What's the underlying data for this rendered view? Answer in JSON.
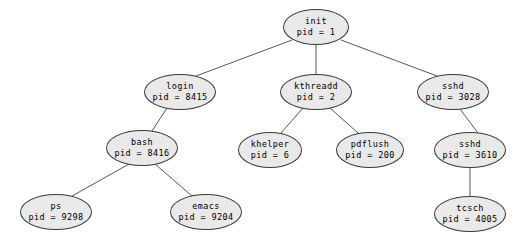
{
  "diagram": {
    "background_color": "#ffffff",
    "node_fill": "#e9e9e9",
    "node_stroke": "#3a3a3a",
    "edge_color": "#444444",
    "nodes": [
      {
        "id": "init",
        "name": "init",
        "pid_label": "pid = 1",
        "cx": 316,
        "cy": 27,
        "rx": 33,
        "ry": 18
      },
      {
        "id": "login",
        "name": "login",
        "pid_label": "pid = 8415",
        "cx": 180,
        "cy": 92,
        "rx": 36,
        "ry": 18
      },
      {
        "id": "kthreadd",
        "name": "kthreadd",
        "pid_label": "pid = 2",
        "cx": 316,
        "cy": 92,
        "rx": 36,
        "ry": 18
      },
      {
        "id": "sshd3028",
        "name": "sshd",
        "pid_label": "pid = 3028",
        "cx": 453,
        "cy": 92,
        "rx": 36,
        "ry": 18
      },
      {
        "id": "bash",
        "name": "bash",
        "pid_label": "pid = 8416",
        "cx": 142,
        "cy": 148,
        "rx": 36,
        "ry": 18
      },
      {
        "id": "khelper",
        "name": "khelper",
        "pid_label": "pid = 6",
        "cx": 270,
        "cy": 150,
        "rx": 32,
        "ry": 18
      },
      {
        "id": "pdflush",
        "name": "pdflush",
        "pid_label": "pid = 200",
        "cx": 370,
        "cy": 150,
        "rx": 34,
        "ry": 18
      },
      {
        "id": "sshd3610",
        "name": "sshd",
        "pid_label": "pid = 3610",
        "cx": 470,
        "cy": 150,
        "rx": 36,
        "ry": 18
      },
      {
        "id": "ps",
        "name": "ps",
        "pid_label": "pid = 9298",
        "cx": 56,
        "cy": 212,
        "rx": 36,
        "ry": 18
      },
      {
        "id": "emacs",
        "name": "emacs",
        "pid_label": "pid = 9204",
        "cx": 206,
        "cy": 212,
        "rx": 36,
        "ry": 18
      },
      {
        "id": "tcsch",
        "name": "tcsch",
        "pid_label": "pid = 4005",
        "cx": 470,
        "cy": 214,
        "rx": 36,
        "ry": 18
      }
    ],
    "edges": [
      {
        "from": "init",
        "to": "login",
        "x1": 292,
        "y1": 40,
        "x2": 196,
        "y2": 76
      },
      {
        "from": "init",
        "to": "kthreadd",
        "x1": 316,
        "y1": 45,
        "x2": 316,
        "y2": 74
      },
      {
        "from": "init",
        "to": "sshd3028",
        "x1": 341,
        "y1": 40,
        "x2": 437,
        "y2": 76
      },
      {
        "from": "login",
        "to": "bash",
        "x1": 167,
        "y1": 108,
        "x2": 152,
        "y2": 131
      },
      {
        "from": "kthreadd",
        "to": "khelper",
        "x1": 303,
        "y1": 108,
        "x2": 281,
        "y2": 133
      },
      {
        "from": "kthreadd",
        "to": "pdflush",
        "x1": 330,
        "y1": 108,
        "x2": 358,
        "y2": 133
      },
      {
        "from": "sshd3028",
        "to": "sshd3610",
        "x1": 460,
        "y1": 109,
        "x2": 478,
        "y2": 133
      },
      {
        "from": "bash",
        "to": "ps",
        "x1": 129,
        "y1": 164,
        "x2": 72,
        "y2": 196
      },
      {
        "from": "bash",
        "to": "emacs",
        "x1": 155,
        "y1": 164,
        "x2": 192,
        "y2": 196
      },
      {
        "from": "sshd3610",
        "to": "tcsch",
        "x1": 470,
        "y1": 168,
        "x2": 470,
        "y2": 196
      }
    ]
  }
}
